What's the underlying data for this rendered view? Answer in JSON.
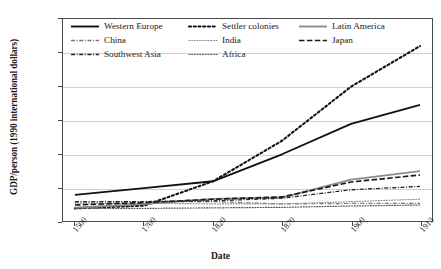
{
  "chart_data": {
    "type": "line",
    "title": "",
    "xlabel": "Date",
    "ylabel": "GDP/person (1990 international dollars)",
    "categories": [
      "1500",
      "1700",
      "1820",
      "1870",
      "1900",
      "1913"
    ],
    "x_tick_labels": [
      "1500",
      "1700",
      "1820",
      "1870",
      "1900",
      "1913"
    ],
    "y_tick_labels": [
      "0",
      "1000",
      "2000",
      "3000",
      "4000",
      "5000",
      "6000"
    ],
    "y_ticks": [
      0,
      1000,
      2000,
      3000,
      4000,
      5000,
      6000
    ],
    "ylim": [
      0,
      6000
    ],
    "grid": "horizontal",
    "legend_position": "top-inside",
    "legend_columns": 3,
    "series": [
      {
        "name": "Western Europe",
        "values": [
          800,
          1000,
          1200,
          2000,
          2900,
          3460
        ],
        "style": "solid",
        "color": "#111111",
        "width": 1.9
      },
      {
        "name": "Settler colonies",
        "values": [
          400,
          480,
          1200,
          2400,
          4000,
          5200
        ],
        "style": "dotted-thick",
        "color": "#111111",
        "width": 2.1
      },
      {
        "name": "Latin America",
        "values": [
          420,
          530,
          680,
          720,
          1250,
          1500
        ],
        "style": "solid",
        "color": "#8c8c8c",
        "width": 1.9
      },
      {
        "name": "China",
        "values": [
          600,
          600,
          600,
          530,
          545,
          550
        ],
        "style": "dash-dot",
        "color": "#777777",
        "width": 1.2
      },
      {
        "name": "India",
        "values": [
          550,
          550,
          533,
          533,
          599,
          673
        ],
        "style": "dotted-fine",
        "color": "#8a8a8a",
        "width": 1.1
      },
      {
        "name": "Japan",
        "values": [
          500,
          570,
          669,
          737,
          1180,
          1387
        ],
        "style": "long-dash",
        "color": "#1a1a1a",
        "width": 1.7
      },
      {
        "name": "Southwest Asia",
        "values": [
          590,
          600,
          620,
          700,
          950,
          1050
        ],
        "style": "dash-dot",
        "color": "#222222",
        "width": 1.3
      },
      {
        "name": "Africa",
        "values": [
          400,
          400,
          415,
          430,
          470,
          500
        ],
        "style": "dotted-fine",
        "color": "#555555",
        "width": 1.2
      }
    ]
  },
  "legend": {
    "items": [
      {
        "label": "Western Europe",
        "style": "solid",
        "color": "#111111"
      },
      {
        "label": "Settler colonies",
        "style": "dotted-thick",
        "color": "#111111"
      },
      {
        "label": "Latin America",
        "style": "solid",
        "color": "#8c8c8c"
      },
      {
        "label": "China",
        "style": "dash-dot",
        "color": "#777777"
      },
      {
        "label": "India",
        "style": "dotted-fine",
        "color": "#8a8a8a"
      },
      {
        "label": "Japan",
        "style": "long-dash",
        "color": "#1a1a1a"
      },
      {
        "label": "Southwest Asia",
        "style": "dash-dot",
        "color": "#222222"
      },
      {
        "label": "Africa",
        "style": "dotted-fine",
        "color": "#555555"
      }
    ]
  },
  "colors": {
    "axis": "#4a4a4a",
    "grid": "#d0d0d0",
    "background": "#ffffff",
    "text": "#1a1a1a"
  }
}
